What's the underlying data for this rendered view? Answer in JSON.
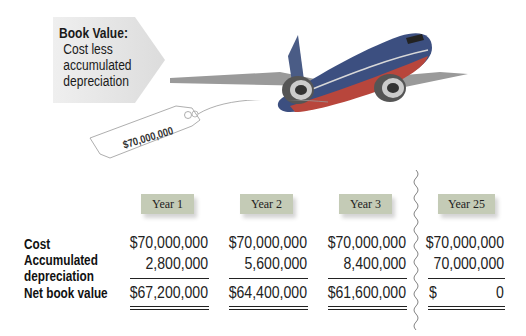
{
  "callout": {
    "title": "Book Value:",
    "lines": [
      "Cost less",
      "accumulated",
      "depreciation"
    ]
  },
  "price_tag": {
    "label": "$70,000,000"
  },
  "illustration": {
    "subject": "airplane-icon"
  },
  "table": {
    "row_labels": {
      "cost": "Cost",
      "accum_line1": "Accumulated",
      "accum_line2": "depreciation",
      "net": "Net book value"
    },
    "columns": [
      {
        "year": "Year 1",
        "cost": "$70,000,000",
        "accumulated_depreciation": "2,800,000",
        "net_book_value": "$67,200,000"
      },
      {
        "year": "Year 2",
        "cost": "$70,000,000",
        "accumulated_depreciation": "5,600,000",
        "net_book_value": "$64,400,000"
      },
      {
        "year": "Year 3",
        "cost": "$70,000,000",
        "accumulated_depreciation": "8,400,000",
        "net_book_value": "$61,600,000"
      },
      {
        "year": "Year 25",
        "cost": "$70,000,000",
        "accumulated_depreciation": "70,000,000",
        "net_book_value_symbol": "$",
        "net_book_value": "0"
      }
    ]
  },
  "colors": {
    "year_label_bg": "#c4cbb6",
    "callout_bg": "#e6e6e6"
  }
}
